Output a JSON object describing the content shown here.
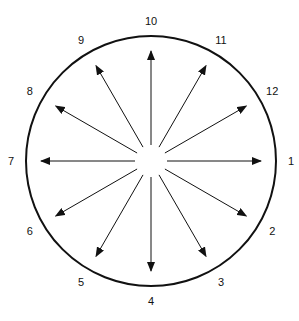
{
  "diagram": {
    "type": "radial-arrow-dial",
    "center": {
      "x": 151,
      "y": 161
    },
    "circle_radius": 125,
    "arrow_inner_radius": 16,
    "arrow_tip_radius": 110,
    "label_radius": 140,
    "colors": {
      "stroke": "#111111",
      "background": "#ffffff"
    },
    "directions": [
      {
        "label": "1",
        "angle_deg": 0
      },
      {
        "label": "12",
        "angle_deg": 30
      },
      {
        "label": "11",
        "angle_deg": 60
      },
      {
        "label": "10",
        "angle_deg": 90
      },
      {
        "label": "9",
        "angle_deg": 120
      },
      {
        "label": "8",
        "angle_deg": 150
      },
      {
        "label": "7",
        "angle_deg": 180
      },
      {
        "label": "6",
        "angle_deg": 210
      },
      {
        "label": "5",
        "angle_deg": 240
      },
      {
        "label": "4",
        "angle_deg": 270
      },
      {
        "label": "3",
        "angle_deg": 300
      },
      {
        "label": "2",
        "angle_deg": 330
      }
    ]
  }
}
